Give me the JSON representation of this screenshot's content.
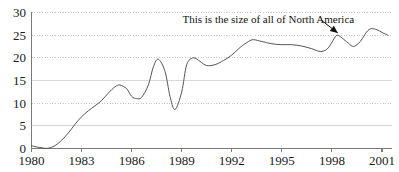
{
  "chart_data": {
    "type": "line",
    "title": "",
    "subtitle": "",
    "xlabel": "",
    "ylabel": "",
    "xlim": [
      1980,
      2001.6
    ],
    "ylim": [
      0,
      30
    ],
    "grid": true,
    "grid_style": "dotted-horizontal",
    "legend": false,
    "legend_position": "none",
    "y_ticks": [
      0,
      5,
      10,
      15,
      20,
      25,
      30
    ],
    "y_tick_labels": [
      "0",
      "5",
      "10",
      "15",
      "20",
      "25",
      "30"
    ],
    "x_ticks": [
      1980,
      1983,
      1986,
      1989,
      1992,
      1995,
      1998,
      2001
    ],
    "x_tick_labels": [
      "1980",
      "1983",
      "1986",
      "1989",
      "1992",
      "1995",
      "1998",
      "2001"
    ],
    "series": [
      {
        "name": "series-1",
        "color": "#555555",
        "x": [
          1980.0,
          1980.3,
          1980.7,
          1981.0,
          1981.4,
          1981.8,
          1982.2,
          1982.6,
          1983.0,
          1983.4,
          1983.8,
          1984.2,
          1984.6,
          1985.0,
          1985.3,
          1985.7,
          1986.0,
          1986.3,
          1986.6,
          1987.0,
          1987.3,
          1987.6,
          1988.0,
          1988.3,
          1988.6,
          1989.0,
          1989.3,
          1989.7,
          1990.1,
          1990.5,
          1991.0,
          1991.5,
          1992.0,
          1992.5,
          1993.0,
          1993.3,
          1993.8,
          1994.4,
          1995.0,
          1995.6,
          1996.2,
          1996.8,
          1997.3,
          1997.7,
          1998.0,
          1998.3,
          1998.7,
          1999.0,
          1999.3,
          1999.7,
          2000.0,
          2000.3,
          2000.7,
          2001.0,
          2001.35
        ],
        "y": [
          0.6,
          0.35,
          0.1,
          0.05,
          0.6,
          1.8,
          3.4,
          5.3,
          7.0,
          8.3,
          9.4,
          10.6,
          12.2,
          13.6,
          14.0,
          13.2,
          11.5,
          11.0,
          11.3,
          14.0,
          18.0,
          19.7,
          17.0,
          11.5,
          8.6,
          12.5,
          18.5,
          20.0,
          19.2,
          18.3,
          18.5,
          19.4,
          20.6,
          22.3,
          23.6,
          24.0,
          23.6,
          23.1,
          22.9,
          22.9,
          22.6,
          22.0,
          21.4,
          21.9,
          23.4,
          25.0,
          24.1,
          23.2,
          22.5,
          23.6,
          25.3,
          26.4,
          26.2,
          25.6,
          25.0
        ],
        "line_width": 1.0
      }
    ],
    "annotations": [
      {
        "name": "north-america-annotation",
        "text": "This is the size of all of North America",
        "text_x": 1994.2,
        "text_y": 28.6,
        "arrow_from_x": 1997.4,
        "arrow_from_y": 28.2,
        "arrow_to_x": 1998.35,
        "arrow_to_y": 25.5,
        "color": "#111111"
      }
    ],
    "axis_color": "#7a7a7a",
    "grid_color": "#bfbfbf",
    "background": "#ffffff"
  }
}
